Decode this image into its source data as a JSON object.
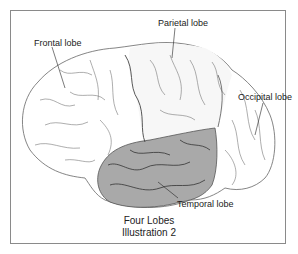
{
  "diagram": {
    "type": "anatomical-illustration",
    "labels": {
      "frontal": "Frontal lobe",
      "parietal": "Parietal lobe",
      "occipital": "Occipital lobe",
      "temporal": "Temporal lobe"
    },
    "caption": {
      "line1": "Four Lobes",
      "line2": "Illustration 2"
    },
    "colors": {
      "frame": "#8a8a8a",
      "outline": "#555555",
      "temporal_fill": "#a9a9a9",
      "background": "#ffffff"
    }
  }
}
